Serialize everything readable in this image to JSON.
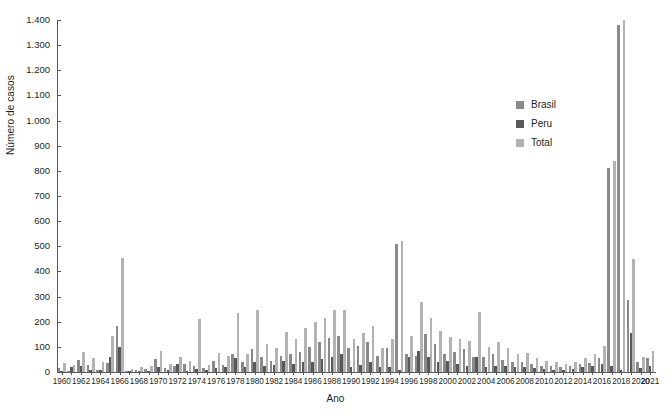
{
  "chart_data": {
    "type": "bar",
    "title": "",
    "xlabel": "Ano",
    "ylabel": "Número de casos",
    "ylim": [
      0,
      1400
    ],
    "ytick_step": 100,
    "ytick_labels": [
      "0",
      "100",
      "200",
      "300",
      "400",
      "500",
      "600",
      "700",
      "800",
      "900",
      "1.000",
      "1.100",
      "1.200",
      "1.300",
      "1.400"
    ],
    "grid": false,
    "legend_position": "upper right",
    "colors": {
      "Brasil": "#8a8a8a",
      "Peru": "#595959",
      "Total": "#b3b3b3"
    },
    "x": [
      1960,
      1961,
      1962,
      1963,
      1964,
      1965,
      1966,
      1967,
      1968,
      1969,
      1970,
      1971,
      1972,
      1973,
      1974,
      1975,
      1976,
      1977,
      1978,
      1979,
      1980,
      1981,
      1982,
      1983,
      1984,
      1985,
      1986,
      1987,
      1988,
      1989,
      1990,
      1991,
      1992,
      1993,
      1994,
      1995,
      1996,
      1997,
      1998,
      1999,
      2000,
      2001,
      2002,
      2003,
      2004,
      2005,
      2006,
      2007,
      2008,
      2009,
      2010,
      2011,
      2012,
      2013,
      2014,
      2015,
      2016,
      2017,
      2018,
      2019,
      2020,
      2021
    ],
    "xtick_labels_every": 2,
    "xtick_labels": [
      "1960",
      "1962",
      "1964",
      "1966",
      "1968",
      "1970",
      "1972",
      "1974",
      "1976",
      "1978",
      "1980",
      "1982",
      "1984",
      "1986",
      "1988",
      "1990",
      "1992",
      "1994",
      "1996",
      "1998",
      "2000",
      "2002",
      "2004",
      "2006",
      "2008",
      "2010",
      "2012",
      "2014",
      "2016",
      "2018",
      "2020"
    ],
    "series": [
      {
        "name": "Brasil",
        "values": [
          15,
          5,
          46,
          27,
          10,
          35,
          185,
          5,
          8,
          12,
          50,
          16,
          22,
          30,
          25,
          14,
          42,
          27,
          70,
          40,
          90,
          60,
          45,
          62,
          70,
          80,
          100,
          120,
          135,
          145,
          95,
          105,
          120,
          65,
          95,
          510,
          70,
          62,
          150,
          110,
          70,
          80,
          90,
          60,
          60,
          70,
          48,
          40,
          38,
          30,
          24,
          22,
          20,
          22,
          30,
          35,
          55,
          810,
          1380,
          285,
          38,
          55
        ]
      },
      {
        "name": "Peru",
        "values": [
          6,
          18,
          22,
          10,
          8,
          58,
          100,
          2,
          4,
          5,
          20,
          8,
          32,
          5,
          12,
          8,
          15,
          20,
          55,
          18,
          38,
          22,
          28,
          45,
          32,
          40,
          38,
          52,
          60,
          70,
          20,
          28,
          40,
          18,
          20,
          8,
          60,
          85,
          58,
          40,
          42,
          30,
          25,
          60,
          20,
          22,
          25,
          18,
          20,
          15,
          12,
          10,
          8,
          12,
          18,
          22,
          30,
          25,
          10,
          155,
          15,
          22
        ]
      },
      {
        "name": "Total",
        "values": [
          35,
          28,
          80,
          56,
          40,
          145,
          455,
          12,
          18,
          25,
          85,
          30,
          60,
          42,
          210,
          28,
          75,
          65,
          235,
          70,
          245,
          110,
          95,
          160,
          130,
          175,
          200,
          215,
          245,
          245,
          130,
          155,
          185,
          95,
          130,
          520,
          145,
          280,
          215,
          165,
          140,
          130,
          125,
          240,
          100,
          120,
          95,
          70,
          75,
          55,
          45,
          38,
          32,
          38,
          55,
          70,
          105,
          840,
          1400,
          450,
          60,
          82
        ]
      }
    ]
  },
  "legend": {
    "items": [
      {
        "label": "Brasil",
        "color": "#8a8a8a"
      },
      {
        "label": "Peru",
        "color": "#595959"
      },
      {
        "label": "Total",
        "color": "#b3b3b3"
      }
    ]
  },
  "axes": {
    "x_title": "Ano",
    "y_title": "Número de casos"
  }
}
